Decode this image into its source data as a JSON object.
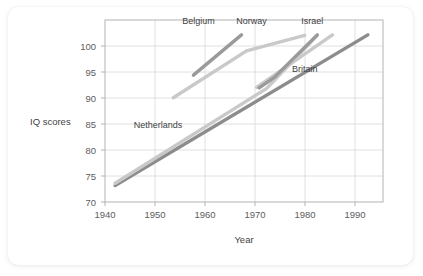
{
  "chart_data": {
    "type": "line",
    "title": "",
    "xlabel": "Year",
    "ylabel": "IQ scores",
    "xlim": [
      1940,
      1995
    ],
    "ylim": [
      70,
      103
    ],
    "xticks": [
      1940,
      1950,
      1960,
      1970,
      1980,
      1990
    ],
    "yticks": [
      70,
      75,
      80,
      85,
      90,
      95,
      100
    ],
    "grid": true,
    "legend_position": "inline-annotations",
    "series": [
      {
        "name": "Britain",
        "color": "#8c8c8c",
        "label_x": 1979.5,
        "label_y": 93.6,
        "points": [
          {
            "x": 1942,
            "y": 73.0
          },
          {
            "x": 1992,
            "y": 100.3
          }
        ]
      },
      {
        "name": "Netherlands",
        "color": "#c9c9c9",
        "label_x": 1950.5,
        "label_y": 83.4,
        "points": [
          {
            "x": 1942,
            "y": 73.4
          },
          {
            "x": 1972,
            "y": 90.6
          },
          {
            "x": 1982,
            "y": 100.2
          }
        ]
      },
      {
        "name": "Belgium",
        "color": "#9a9a9a",
        "label_x": 1958.5,
        "label_y": 102.3,
        "points": [
          {
            "x": 1957.5,
            "y": 93.0
          },
          {
            "x": 1967,
            "y": 100.3
          }
        ]
      },
      {
        "name": "Norway",
        "color": "#c9c9c9",
        "label_x": 1969.0,
        "label_y": 102.3,
        "points": [
          {
            "x": 1953.5,
            "y": 88.9
          },
          {
            "x": 1968,
            "y": 97.4
          },
          {
            "x": 1979.5,
            "y": 100.2
          }
        ]
      },
      {
        "name": "Israel",
        "color": "#c9c9c9",
        "label_x": 1981.0,
        "label_y": 102.3,
        "points": [
          {
            "x": 1970,
            "y": 90.8
          },
          {
            "x": 1985,
            "y": 100.3
          }
        ]
      },
      {
        "name": "Norway-steep",
        "color": "#9a9a9a",
        "label_x": null,
        "label_y": null,
        "points": [
          {
            "x": 1970.5,
            "y": 90.7
          },
          {
            "x": 1973.5,
            "y": 92.6
          },
          {
            "x": 1982,
            "y": 100.3
          }
        ]
      }
    ]
  },
  "axis": {
    "ylabel_text": "IQ scores",
    "xlabel_text": "Year",
    "ytick_labels": [
      "100",
      "95",
      "90",
      "85",
      "80",
      "75",
      "70"
    ],
    "xtick_labels": [
      "1940",
      "1950",
      "1960",
      "1970",
      "1980",
      "1990"
    ]
  },
  "labels": {
    "belgium": "Belgium",
    "norway": "Norway",
    "israel": "Israel",
    "britain": "Britain",
    "netherlands": "Netherlands"
  }
}
